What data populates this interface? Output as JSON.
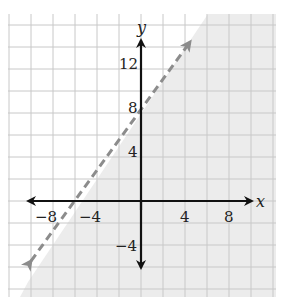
{
  "chart_data": {
    "type": "line",
    "title": "",
    "xlabel": "x",
    "ylabel": "y",
    "x_ticks": [
      -8,
      -4,
      4,
      8
    ],
    "x_tick_labels": [
      "−8",
      "−4",
      "4",
      "8"
    ],
    "y_ticks": [
      12,
      8,
      4,
      -4
    ],
    "y_tick_labels": [
      "12",
      "8",
      "4",
      "−4"
    ],
    "xlim": [
      -12,
      12
    ],
    "ylim": [
      -8.5,
      17
    ],
    "grid": true,
    "grid_step": 2,
    "series": [
      {
        "name": "boundary line y = 2x + 8",
        "style": "dashed",
        "color": "#8c8c8c",
        "x": [
          -10.3,
          4.6
        ],
        "y": [
          -5.6,
          17.2
        ],
        "arrows": "both"
      }
    ],
    "shaded_region": {
      "inequality": "y < 2x + 8",
      "side": "below-right of line",
      "color": "#ececec"
    },
    "annotations": []
  },
  "colors": {
    "grid": "#c8c8c8",
    "axis": "#111111",
    "shade": "#ececec",
    "boundary": "#8c8c8c"
  }
}
